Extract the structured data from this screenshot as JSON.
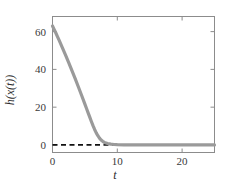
{
  "figure": {
    "background_color": "#ffffff",
    "frame_color": "#8c8c8c",
    "tick_color": "#8c8c8c",
    "text_color": "#3a3a3a"
  },
  "chart_data": {
    "type": "line",
    "title": "",
    "subtitle": "",
    "xlabel": "t",
    "ylabel": "h(x(t))",
    "xlim": [
      0,
      25
    ],
    "ylim": [
      -4,
      68
    ],
    "grid": false,
    "legend": null,
    "xticks": [
      0,
      10,
      20
    ],
    "xtick_labels": [
      "0",
      "10",
      "20"
    ],
    "yticks": [
      0,
      20,
      40,
      60
    ],
    "ytick_labels": [
      "0",
      "20",
      "40",
      "60"
    ],
    "series": [
      {
        "name": "h(x(t))",
        "color": "#9a9a9a",
        "linewidth": 3.2,
        "linestyle": "solid",
        "x": [
          0,
          0.25,
          0.5,
          0.75,
          1,
          1.5,
          2,
          2.5,
          3,
          3.5,
          4,
          4.5,
          5,
          5.25,
          5.5,
          5.75,
          6,
          6.25,
          6.5,
          6.75,
          7,
          7.25,
          7.5,
          7.75,
          8,
          8.5,
          9,
          9.5,
          10,
          11,
          12,
          13,
          14,
          15,
          16,
          17,
          18,
          19,
          20,
          21,
          22,
          23,
          24,
          25
        ],
        "y": [
          63,
          61.2,
          59.4,
          57.5,
          55.6,
          51.7,
          47.7,
          43.6,
          39.4,
          35.1,
          30.7,
          26.2,
          21.6,
          19.3,
          17.0,
          14.7,
          12.4,
          10.2,
          8.2,
          6.4,
          4.9,
          3.6,
          2.6,
          1.9,
          1.35,
          0.75,
          0.42,
          0.24,
          0.14,
          0.06,
          0.03,
          0.02,
          0.01,
          0.0,
          0.0,
          0.0,
          0.0,
          0.0,
          0.0,
          0.0,
          0.0,
          0.0,
          0.0,
          0.0
        ]
      },
      {
        "name": "zero-reference",
        "color": "#111111",
        "linewidth": 1.8,
        "linestyle": "dashed",
        "x": [
          0,
          25
        ],
        "y": [
          0,
          0
        ]
      }
    ]
  }
}
